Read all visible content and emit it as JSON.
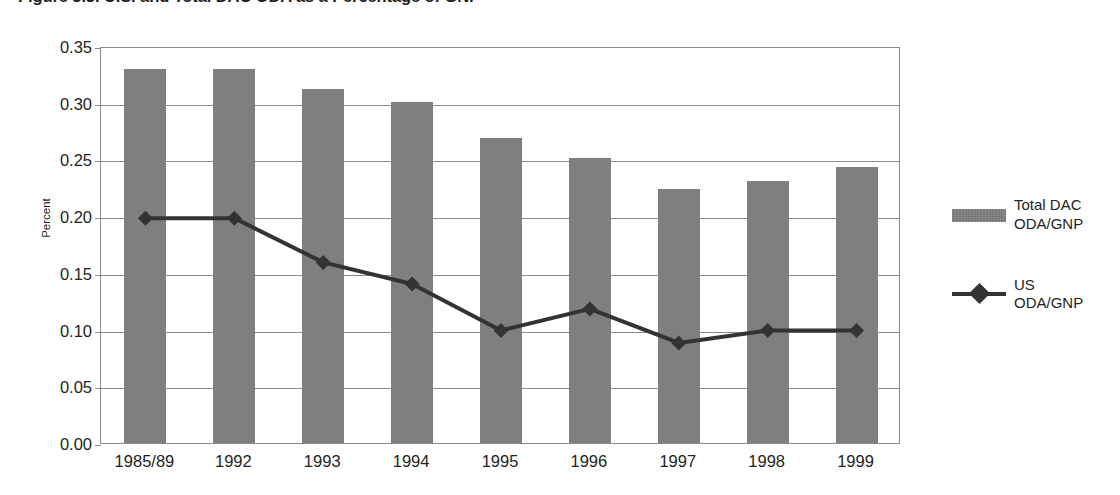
{
  "title": "Figure 3.3. U.S. and Total DAC ODA as a Percentage of GNP",
  "chart_data": {
    "type": "bar",
    "title": "Figure 3.3. U.S. and Total DAC ODA as a Percentage of GNP",
    "xlabel": "",
    "ylabel": "Percent",
    "ylim": [
      0.0,
      0.35
    ],
    "ytick_step": 0.05,
    "grid": true,
    "legend_position": "right",
    "categories": [
      "1985/89",
      "1992",
      "1993",
      "1994",
      "1995",
      "1996",
      "1997",
      "1998",
      "1999"
    ],
    "ytick_labels": [
      "0.35",
      "0.30",
      "0.25",
      "0.20",
      "0.15",
      "0.10",
      "0.05",
      "0.00"
    ],
    "ytick_values": [
      0.35,
      0.3,
      0.25,
      0.2,
      0.15,
      0.1,
      0.05,
      0.0
    ],
    "series": [
      {
        "name": "Total DAC ODA/GNP",
        "legend_label_line1": "Total DAC",
        "legend_label_line2": "ODA/GNP",
        "render": "bar",
        "color": "#7f7f7f",
        "values": [
          0.33,
          0.33,
          0.312,
          0.301,
          0.269,
          0.251,
          0.224,
          0.231,
          0.243
        ]
      },
      {
        "name": "US ODA/GNP",
        "legend_label_line1": "US",
        "legend_label_line2": "ODA/GNP",
        "render": "line",
        "color": "#333333",
        "marker": "diamond",
        "values": [
          0.2,
          0.2,
          0.161,
          0.142,
          0.101,
          0.12,
          0.09,
          0.101,
          0.101
        ]
      }
    ]
  }
}
